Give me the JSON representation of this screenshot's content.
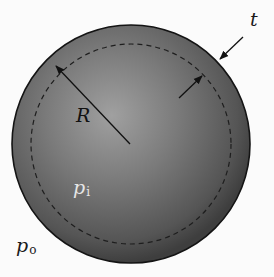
{
  "diagram": {
    "type": "thin-walled spherical pressure vessel",
    "labels": {
      "thickness": "t",
      "radius": "R",
      "inner_pressure": {
        "symbol": "p",
        "subscript": "i"
      },
      "outer_pressure": {
        "symbol": "p",
        "subscript": "o"
      }
    },
    "colors": {
      "background": "#fbfbfb",
      "sphere_shell": "#4a4a4a",
      "sphere_center_highlight": "#9a9a9a",
      "outline": "#141414",
      "dashed_midsurface": "#1e1e1e",
      "inner_pressure_label": "#e6e6e6"
    },
    "geometry": {
      "outer_circle": {
        "cx": 131,
        "cy": 144,
        "r": 119
      },
      "mid_surface_dashed_circle": {
        "cx": 131,
        "cy": 144,
        "r": 100
      }
    }
  }
}
